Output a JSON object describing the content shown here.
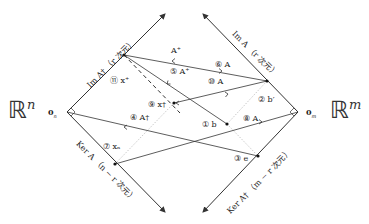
{
  "spaces": {
    "left": {
      "symbol": "ℝ",
      "exp": "n",
      "origin": "0",
      "origin_sub": "n"
    },
    "right": {
      "symbol": "ℝ",
      "exp": "m",
      "origin": "0",
      "origin_sub": "m"
    }
  },
  "axes": {
    "im_a_dagger": "Im A† （r 次元）",
    "ker_a": "Ker A （n − r 次元）",
    "im_a": "Im A （r 次元）",
    "ker_a_dagger": "Ker A† （m − r 次元）"
  },
  "labels": {
    "x_plus": "⑪ x⁺",
    "a_plus_top": "A⁺",
    "a_plus_5": "⑤ A⁺",
    "a_6": "⑥ A",
    "a_10": "⑩ A",
    "b_prime": "② b′",
    "x_dagger": "⑨ x†",
    "a_t_4": "④ A†",
    "b_1": "① b",
    "a_8": "⑧ A",
    "x_n": "⑦ xₙ",
    "e_3": "③ e"
  },
  "colors": {
    "line": "#333333",
    "dotted": "#bbbbbb",
    "text": "#222222"
  }
}
